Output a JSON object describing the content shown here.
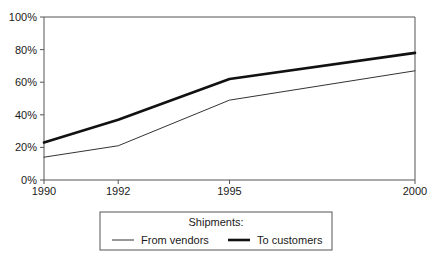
{
  "chart_data": {
    "type": "line",
    "title": "",
    "xlabel": "",
    "ylabel": "",
    "x": [
      1990,
      1992,
      1995,
      2000
    ],
    "x_tick_labels": [
      "1990",
      "1992",
      "1995",
      "2000"
    ],
    "y_tick_labels": [
      "0%",
      "20%",
      "40%",
      "60%",
      "80%",
      "100%"
    ],
    "y_ticks": [
      0,
      20,
      40,
      60,
      80,
      100
    ],
    "ylim": [
      0,
      100
    ],
    "xlim": [
      1990,
      2000
    ],
    "grid": false,
    "legend_position": "below-center",
    "legend_title": "Shipments:",
    "series": [
      {
        "name": "From vendors",
        "style": "thin",
        "color": "#333333",
        "values": [
          14,
          21,
          49,
          67
        ]
      },
      {
        "name": "To customers",
        "style": "thick",
        "color": "#111111",
        "values": [
          23,
          37,
          62,
          78
        ]
      }
    ]
  },
  "axes": {
    "y_axis_name": "percent-axis",
    "x_axis_name": "year-axis"
  }
}
